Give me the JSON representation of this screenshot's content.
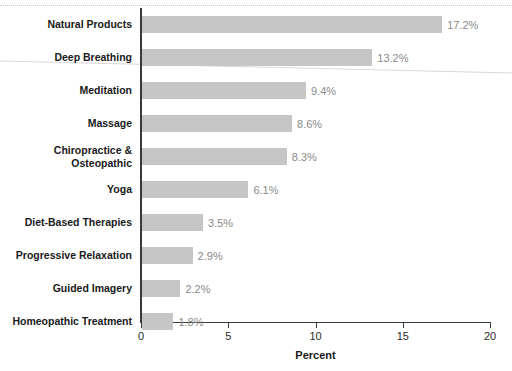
{
  "chart_data": {
    "type": "bar",
    "orientation": "horizontal",
    "title": "",
    "xlabel": "Percent",
    "ylabel": "",
    "xlim": [
      0,
      20
    ],
    "xticks": [
      0,
      5,
      10,
      15,
      20
    ],
    "xtick_labels": [
      "0",
      "5",
      "10",
      "15",
      "20"
    ],
    "grid": false,
    "legend": null,
    "bar_color": "#c6c6c6",
    "value_label_color": "#8a8a8a",
    "axis_color": "#3a3a3a",
    "categories": [
      "Natural Products",
      "Deep Breathing",
      "Meditation",
      "Massage",
      "Chiropractice & Osteopathic",
      "Yoga",
      "Diet-Based Therapies",
      "Progressive Relaxation",
      "Guided Imagery",
      "Homeopathic Treatment"
    ],
    "values": [
      17.2,
      13.2,
      9.4,
      8.6,
      8.3,
      6.1,
      3.5,
      2.9,
      2.2,
      1.8
    ],
    "value_labels": [
      "17.2%",
      "13.2%",
      "9.4%",
      "8.6%",
      "8.3%",
      "6.1%",
      "3.5%",
      "2.9%",
      "2.2%",
      "1.8%"
    ]
  },
  "rows": [
    {
      "label": "Natural Products",
      "label_line1": "Natural Products",
      "label_line2": "",
      "value": 17.2,
      "value_label": "17.2%"
    },
    {
      "label": "Deep Breathing",
      "label_line1": "Deep Breathing",
      "label_line2": "",
      "value": 13.2,
      "value_label": "13.2%"
    },
    {
      "label": "Meditation",
      "label_line1": "Meditation",
      "label_line2": "",
      "value": 9.4,
      "value_label": "9.4%"
    },
    {
      "label": "Massage",
      "label_line1": "Massage",
      "label_line2": "",
      "value": 8.6,
      "value_label": "8.6%"
    },
    {
      "label": "Chiropractice & Osteopathic",
      "label_line1": "Chiropractice &",
      "label_line2": "Osteopathic",
      "value": 8.3,
      "value_label": "8.3%"
    },
    {
      "label": "Yoga",
      "label_line1": "Yoga",
      "label_line2": "",
      "value": 6.1,
      "value_label": "6.1%"
    },
    {
      "label": "Diet-Based Therapies",
      "label_line1": "Diet-Based Therapies",
      "label_line2": "",
      "value": 3.5,
      "value_label": "3.5%"
    },
    {
      "label": "Progressive Relaxation",
      "label_line1": "Progressive Relaxation",
      "label_line2": "",
      "value": 2.9,
      "value_label": "2.9%"
    },
    {
      "label": "Guided Imagery",
      "label_line1": "Guided Imagery",
      "label_line2": "",
      "value": 2.2,
      "value_label": "2.2%"
    },
    {
      "label": "Homeopathic Treatment",
      "label_line1": "Homeopathic Treatment",
      "label_line2": "",
      "value": 1.8,
      "value_label": "1.8%"
    }
  ],
  "axis": {
    "x_title": "Percent",
    "ticks": [
      "0",
      "5",
      "10",
      "15",
      "20"
    ]
  }
}
